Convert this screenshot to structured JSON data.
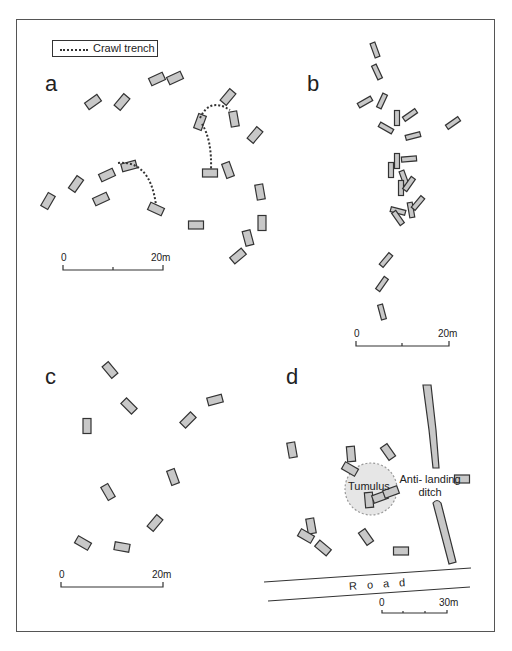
{
  "legend": {
    "line_style": "dotted",
    "label": "Crawl trench"
  },
  "colors": {
    "feature_fill": "#c8c8c8",
    "feature_stroke": "#333333",
    "tumulus_fill": "#e6e6e6",
    "frame": "#555555"
  },
  "panels": {
    "a": {
      "label": "a",
      "scale": {
        "start": "0",
        "end": "20m"
      },
      "features": [
        [
          93,
          102,
          -35
        ],
        [
          122,
          102,
          -50
        ],
        [
          157,
          79,
          -25
        ],
        [
          175,
          78,
          -25
        ],
        [
          48,
          201,
          -60
        ],
        [
          76,
          184,
          -55
        ],
        [
          107,
          175,
          -25
        ],
        [
          129,
          166,
          -15
        ],
        [
          101,
          199,
          -25
        ],
        [
          156,
          209,
          25
        ],
        [
          228,
          97,
          -50
        ],
        [
          200,
          122,
          -70
        ],
        [
          234,
          119,
          80
        ],
        [
          255,
          135,
          -50
        ],
        [
          210,
          173,
          0
        ],
        [
          228,
          170,
          70
        ],
        [
          260,
          192,
          80
        ],
        [
          196,
          225,
          0
        ],
        [
          262,
          223,
          90
        ],
        [
          248,
          238,
          75
        ],
        [
          238,
          256,
          -40
        ]
      ],
      "trenches": [
        "M118,163 Q150,160 156,205",
        "M200,118 Q210,97 230,110",
        "M202,124 Q212,140 211,170"
      ]
    },
    "b": {
      "label": "b",
      "scale": {
        "start": "0",
        "end": "20m"
      },
      "features": [
        [
          375,
          50,
          70
        ],
        [
          377,
          72,
          65
        ],
        [
          365,
          102,
          -30
        ],
        [
          382,
          101,
          -65
        ],
        [
          397,
          118,
          90
        ],
        [
          410,
          115,
          -35
        ],
        [
          386,
          128,
          30
        ],
        [
          413,
          136,
          -15
        ],
        [
          453,
          123,
          -35
        ],
        [
          397,
          161,
          90
        ],
        [
          391,
          170,
          90
        ],
        [
          409,
          159,
          -5
        ],
        [
          404,
          178,
          70
        ],
        [
          401,
          188,
          90
        ],
        [
          409,
          184,
          -55
        ],
        [
          398,
          211,
          15
        ],
        [
          411,
          210,
          80
        ],
        [
          418,
          203,
          -50
        ],
        [
          398,
          218,
          55
        ],
        [
          386,
          260,
          -50
        ],
        [
          382,
          284,
          -55
        ],
        [
          382,
          312,
          75
        ]
      ],
      "trenches": []
    },
    "c": {
      "label": "c",
      "scale": {
        "start": "0",
        "end": "20m"
      },
      "features": [
        [
          110,
          370,
          50
        ],
        [
          129,
          406,
          45
        ],
        [
          215,
          400,
          -15
        ],
        [
          188,
          420,
          -45
        ],
        [
          87,
          426,
          90
        ],
        [
          173,
          477,
          70
        ],
        [
          108,
          492,
          60
        ],
        [
          155,
          523,
          -50
        ],
        [
          83,
          543,
          30
        ],
        [
          122,
          547,
          10
        ]
      ],
      "trenches": []
    },
    "d": {
      "label": "d",
      "scale": {
        "start": "0",
        "end": "30m"
      },
      "features": [
        [
          292,
          450,
          80
        ],
        [
          351,
          454,
          85
        ],
        [
          388,
          452,
          55
        ],
        [
          350,
          469,
          30
        ],
        [
          369,
          500,
          85
        ],
        [
          380,
          497,
          -20
        ],
        [
          391,
          492,
          -20
        ],
        [
          462,
          479,
          0
        ],
        [
          311,
          526,
          80
        ],
        [
          306,
          536,
          30
        ],
        [
          323,
          548,
          40
        ],
        [
          366,
          537,
          55
        ],
        [
          401,
          551,
          0
        ]
      ],
      "trenches": [],
      "tumulus_label": "Tumulus",
      "ditch_label_line1": "Anti- landing",
      "ditch_label_line2": "ditch",
      "road_label": "Road"
    }
  }
}
